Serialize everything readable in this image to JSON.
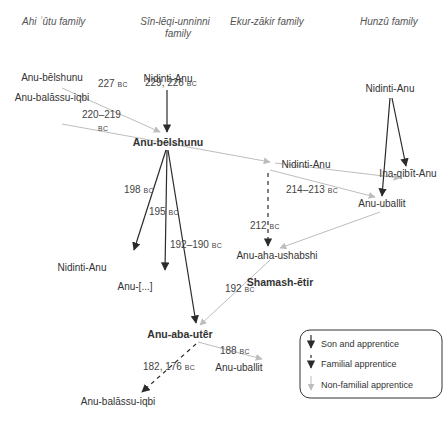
{
  "headers": {
    "ahi_utu": "Ahi ʾûtu family",
    "sin_leqi_line1": "Sîn-lēqi-unninni",
    "sin_leqi_line2": "family",
    "ekur_zakir": "Ekur-zākir family",
    "hunzu": "Hunzû family"
  },
  "nodes": {
    "ahi_anu_belshunu": "Anu-bēlshunu",
    "ahi_anu_balassu": "Anu-balāssu-iqbi",
    "sin_nidinti_top": "Nidinti-Anu",
    "sin_anu_belshunu": "Anu-bēlshunu",
    "sin_nidinti_low": "Nidinti-Anu",
    "sin_anu_elided": "Anu-[...]",
    "sin_anu_aba_uter": "Anu-aba-utêr",
    "sin_anu_balassu_low": "Anu-balāssu-iqbi",
    "sin_anu_uballit_low": "Anu-uballit",
    "ekur_nidinti": "Nidinti-Anu",
    "ekur_anu_aha": "Anu-aha-ushabshi",
    "ekur_shamash": "Shamash-ētir",
    "hunzu_nidinti": "Nidinti-Anu",
    "hunzu_ina_qibit": "Ina-qibīt-Anu",
    "hunzu_anu_uballit": "Anu-uballit"
  },
  "dates": {
    "d227": "227",
    "d229_226": "229, 226",
    "d220_219": "220–219",
    "d198": "198",
    "d195": "195",
    "d192_190": "192–190",
    "d214_213": "214–213",
    "d212": "212",
    "d192": "192",
    "d188": "188",
    "d182_176": "182, 176",
    "bc": "BC"
  },
  "legend": {
    "son": "Son and apprentice",
    "familial": "Familial apprentice",
    "nonfamilial": "Non-familial apprentice"
  },
  "colors": {
    "son": "#333333",
    "familial": "#333333",
    "nonfamilial": "#bbbbbb"
  }
}
